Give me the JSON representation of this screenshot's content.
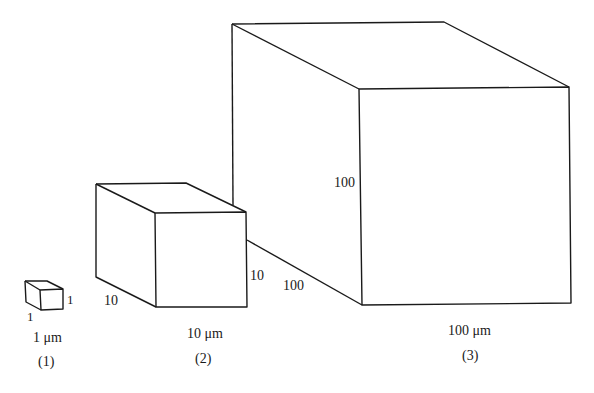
{
  "figure": {
    "type": "scaling-cubes-comparison",
    "line_color": "#1a1a1a",
    "background": "#ffffff"
  },
  "cubes": [
    {
      "id": "1",
      "edge_labels": {
        "depth": "1",
        "height": "1"
      },
      "size_label": "1 μm",
      "caption": "(1)"
    },
    {
      "id": "2",
      "edge_labels": {
        "depth": "10",
        "height": "10"
      },
      "size_label": "10 μm",
      "caption": "(2)"
    },
    {
      "id": "3",
      "edge_labels": {
        "depth": "100",
        "height": "100"
      },
      "size_label": "100 μm",
      "caption": "(3)"
    }
  ]
}
